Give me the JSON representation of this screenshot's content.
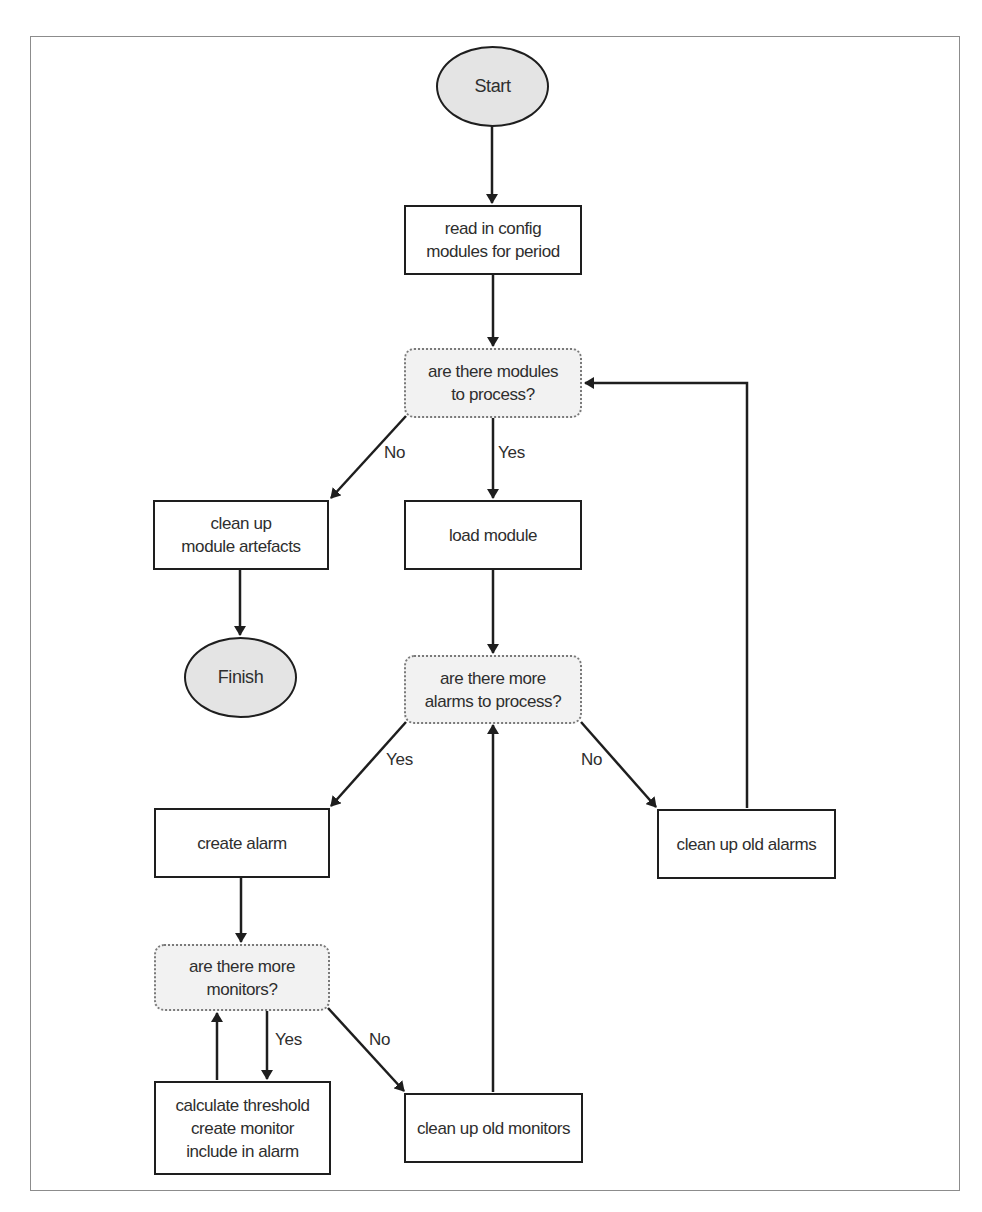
{
  "diagram": {
    "type": "flowchart",
    "nodes": {
      "start": {
        "shape": "ellipse",
        "label": "Start"
      },
      "read_config": {
        "shape": "process",
        "label": "read in config\nmodules for period"
      },
      "modules_decision": {
        "shape": "decision",
        "label": "are there modules\nto process?"
      },
      "cleanup_artefacts": {
        "shape": "process",
        "label": "clean up\nmodule artefacts"
      },
      "finish": {
        "shape": "ellipse",
        "label": "Finish"
      },
      "load_module": {
        "shape": "process",
        "label": "load module"
      },
      "alarms_decision": {
        "shape": "decision",
        "label": "are there more\nalarms to process?"
      },
      "create_alarm": {
        "shape": "process",
        "label": "create alarm"
      },
      "cleanup_alarms": {
        "shape": "process",
        "label": "clean up old alarms"
      },
      "monitors_decision": {
        "shape": "decision",
        "label": "are there more\nmonitors?"
      },
      "calculate_threshold": {
        "shape": "process",
        "label": "calculate threshold\ncreate monitor\ninclude in alarm"
      },
      "cleanup_monitors": {
        "shape": "process",
        "label": "clean up old monitors"
      }
    },
    "edges": [
      {
        "from": "start",
        "to": "read_config",
        "label": ""
      },
      {
        "from": "read_config",
        "to": "modules_decision",
        "label": ""
      },
      {
        "from": "modules_decision",
        "to": "cleanup_artefacts",
        "label": "No"
      },
      {
        "from": "modules_decision",
        "to": "load_module",
        "label": "Yes"
      },
      {
        "from": "cleanup_artefacts",
        "to": "finish",
        "label": ""
      },
      {
        "from": "load_module",
        "to": "alarms_decision",
        "label": ""
      },
      {
        "from": "alarms_decision",
        "to": "create_alarm",
        "label": "Yes"
      },
      {
        "from": "alarms_decision",
        "to": "cleanup_alarms",
        "label": "No"
      },
      {
        "from": "cleanup_alarms",
        "to": "modules_decision",
        "label": ""
      },
      {
        "from": "create_alarm",
        "to": "monitors_decision",
        "label": ""
      },
      {
        "from": "monitors_decision",
        "to": "calculate_threshold",
        "label": "Yes"
      },
      {
        "from": "calculate_threshold",
        "to": "monitors_decision",
        "label": ""
      },
      {
        "from": "monitors_decision",
        "to": "cleanup_monitors",
        "label": "No"
      },
      {
        "from": "cleanup_monitors",
        "to": "alarms_decision",
        "label": ""
      }
    ],
    "edge_labels": {
      "modules_no": "No",
      "modules_yes": "Yes",
      "alarms_yes": "Yes",
      "alarms_no": "No",
      "monitors_yes": "Yes",
      "monitors_no": "No"
    },
    "colors": {
      "line": "#1e1e1e",
      "terminal_fill": "#e4e4e4",
      "decision_fill": "#f2f2f2",
      "decision_border": "#7a7a7a",
      "frame": "#8c8c8c"
    }
  }
}
